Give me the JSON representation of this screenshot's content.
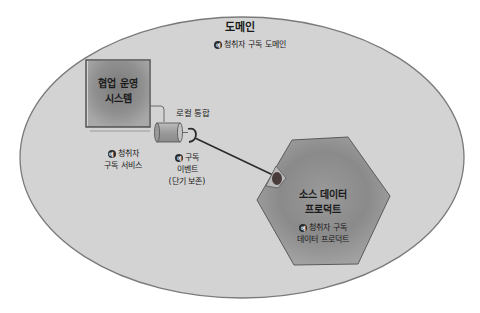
{
  "diagram": {
    "domain": {
      "title": "도메인",
      "badge": "예",
      "subtitle": "청취자 구독 도메인"
    },
    "operational_system": {
      "line1": "협업 운영",
      "line2": "시스템",
      "badge": "예",
      "caption_line1": "청취자",
      "caption_line2": "구독 서비스"
    },
    "local_integration": {
      "label": "로컬 통합"
    },
    "event": {
      "badge": "예",
      "line1": "구독",
      "line2": "이벤트",
      "line3": "(단기 보존)"
    },
    "source_data_product": {
      "line1": "소스 데이터",
      "line2": "프로덕트",
      "badge": "예",
      "caption_line1": "청취자 구독",
      "caption_line2": "데이터 프로덕트"
    },
    "colors": {
      "ellipse_fill": "#d2d2d2",
      "ellipse_stroke": "#7a7a7a",
      "block_fill": "#8e8e8e",
      "outline": "#4a4a4a",
      "connector": "#2b2b2b",
      "socket": "#4a3a3a"
    }
  }
}
